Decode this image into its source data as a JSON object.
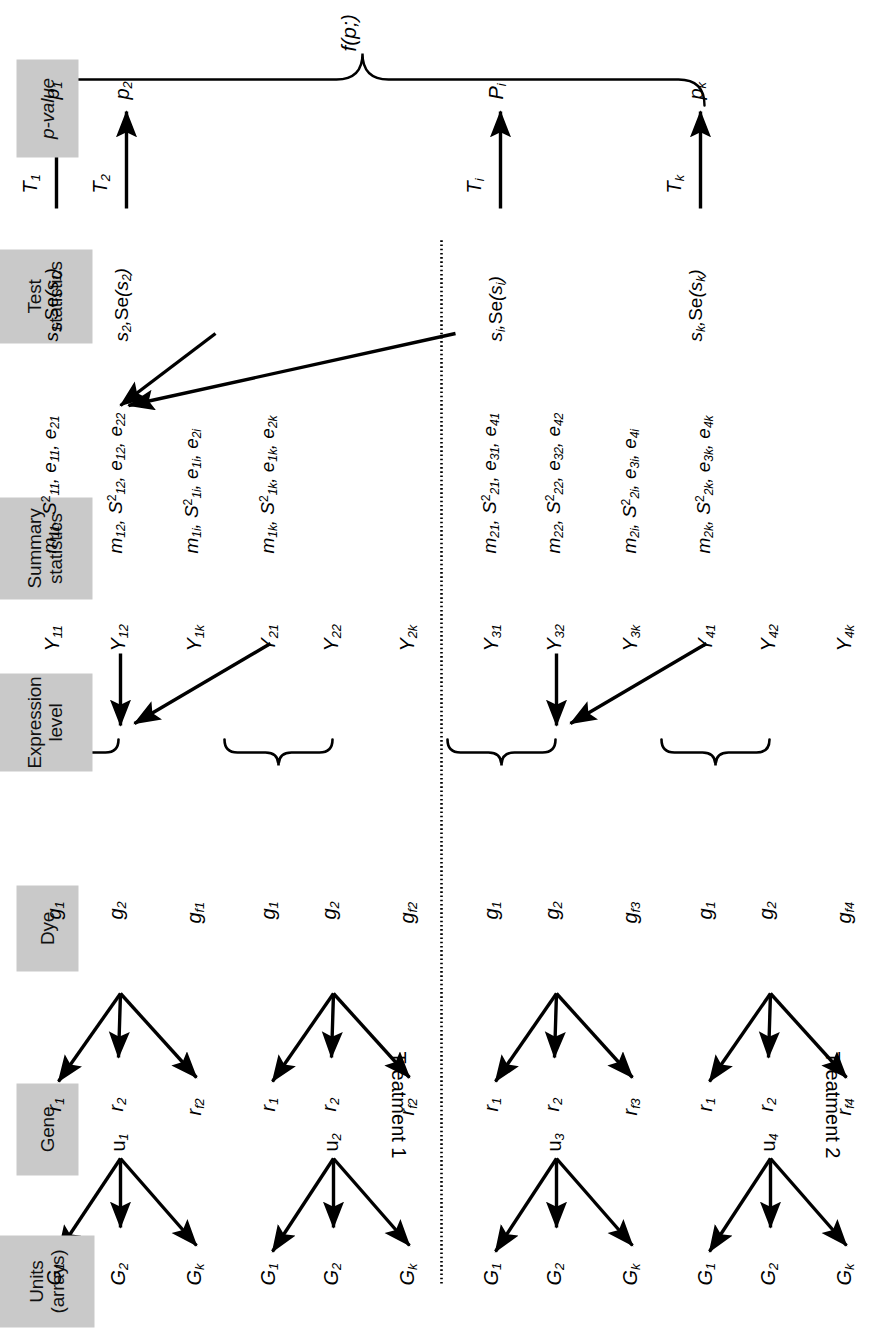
{
  "figure": {
    "caption_formula": "f(p;)",
    "divider": "dotted-vertical-separator"
  },
  "columns": [
    {
      "id": "units",
      "label": "Units\n(arrays)"
    },
    {
      "id": "gene",
      "label": "Gene"
    },
    {
      "id": "dye",
      "label": "Dye"
    },
    {
      "id": "expr",
      "label": "Expression\nlevel"
    },
    {
      "id": "summary",
      "label": "Summary\nstatistics"
    },
    {
      "id": "test",
      "label": "Test\nstatistics"
    },
    {
      "id": "pvalue",
      "label": "p-value"
    }
  ],
  "treatments": [
    {
      "id": "t1",
      "label": "Treatment 1"
    },
    {
      "id": "t2",
      "label": "Treatment 2"
    }
  ],
  "units": [
    {
      "id": "u1",
      "base": "u",
      "sub": "1"
    },
    {
      "id": "u2",
      "base": "u",
      "sub": "2"
    },
    {
      "id": "u3",
      "base": "u",
      "sub": "3"
    },
    {
      "id": "u4",
      "base": "u",
      "sub": "4"
    }
  ],
  "genes": [
    {
      "base": "G",
      "sub": "1"
    },
    {
      "base": "G",
      "sub": "2"
    },
    {
      "base": "G",
      "sub": "k"
    }
  ],
  "dyes": {
    "red": [
      [
        "r",
        "1"
      ],
      [
        "r",
        "2"
      ],
      [
        "r",
        "f1"
      ]
    ],
    "green": [
      [
        "g",
        "1"
      ],
      [
        "g",
        "2"
      ],
      [
        "g",
        "f1"
      ]
    ],
    "rows": [
      {
        "unit": "u1",
        "red": [
          "r1",
          "r2",
          "rf2"
        ],
        "green": [
          "g1",
          "g2",
          "gf1"
        ]
      },
      {
        "unit": "u2",
        "red": [
          "r1",
          "r2",
          "rf2"
        ],
        "green": [
          "g1",
          "g2",
          "gf2"
        ]
      },
      {
        "unit": "u3",
        "red": [
          "r1",
          "r2",
          "rf3"
        ],
        "green": [
          "g1",
          "g2",
          "gf3"
        ]
      },
      {
        "unit": "u4",
        "red": [
          "r1",
          "r2",
          "rf4"
        ],
        "green": [
          "g1",
          "g2",
          "gf4"
        ]
      }
    ]
  },
  "expression_levels": [
    [
      "Y",
      "11"
    ],
    [
      "Y",
      "12"
    ],
    [
      "Y",
      "1k"
    ],
    [
      "Y",
      "21"
    ],
    [
      "Y",
      "22"
    ],
    [
      "Y",
      "2k"
    ],
    [
      "Y",
      "31"
    ],
    [
      "Y",
      "32"
    ],
    [
      "Y",
      "3k"
    ],
    [
      "Y",
      "41"
    ],
    [
      "Y",
      "42"
    ],
    [
      "Y",
      "4k"
    ]
  ],
  "summary_statistics": [
    "m11, S²11, e11, e21",
    "m12, S²12, e12, e22",
    "m1i, S²1i, e1i, e2i",
    "m1k, S²1k, e1k, e2k",
    "m21, S²21, e31, e41",
    "m22, S²22, e32, e42",
    "m2i, S²2i, e3i, e4i",
    "m2k, S²2k, e3k, e4k"
  ],
  "test_statistics": [
    {
      "se": "s1,Se(s1)",
      "t": "T1",
      "p": "p1"
    },
    {
      "se": "s2,Se(s2)",
      "t": "T2",
      "p": "p2"
    },
    {
      "se": "si,Se(si)",
      "t": "Ti",
      "p": "Pi"
    },
    {
      "se": "sk,Se(sk)",
      "t": "Tk",
      "p": "pk"
    }
  ],
  "labels": {
    "u1": "u",
    "u2": "u",
    "u3": "u",
    "u4": "u",
    "unit_subs": [
      "1",
      "2",
      "3",
      "4"
    ],
    "gene_syms": [
      "G",
      "G",
      "G"
    ],
    "gene_subs": [
      "1",
      "2",
      "k"
    ],
    "r_sym": "r",
    "g_sym": "g",
    "Y_sym": "Y",
    "m_sym": "m",
    "S_sym": "S",
    "e_sym": "e",
    "s_sym": "s",
    "Se_sym": "Se",
    "T_sym": "T",
    "p_sym": "p",
    "P_sym": "P"
  },
  "colors": {
    "header_chip": "#c9c9c9",
    "ink": "#000000",
    "background": "#ffffff"
  }
}
